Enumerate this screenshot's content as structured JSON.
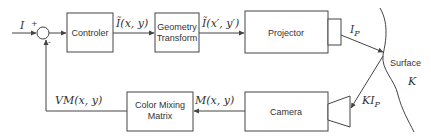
{
  "diagram": {
    "input": {
      "label": "I",
      "plus": "+",
      "minus": "-"
    },
    "blocks": {
      "controller": {
        "label": "Controler"
      },
      "geometry": {
        "line1": "Geometry",
        "line2": "Transform"
      },
      "projector": {
        "label": "Projector"
      },
      "camera": {
        "label": "Camera"
      },
      "color_mixing": {
        "line1": "Color Mixing",
        "line2": "Matrix"
      }
    },
    "signals": {
      "controller_out": "Ĩ(x, y)",
      "geometry_out": "Ĩ(x′, y′)",
      "projector_out": "I",
      "projector_out_sub": "P",
      "reflected": "KI",
      "reflected_sub": "P",
      "camera_out": "M(x, y)",
      "feedback": "VM(x, y)"
    },
    "surface": {
      "label": "Surface",
      "symbol": "K"
    },
    "colors": {
      "stroke": "#444444",
      "text": "#333333",
      "background": "#ffffff"
    }
  }
}
